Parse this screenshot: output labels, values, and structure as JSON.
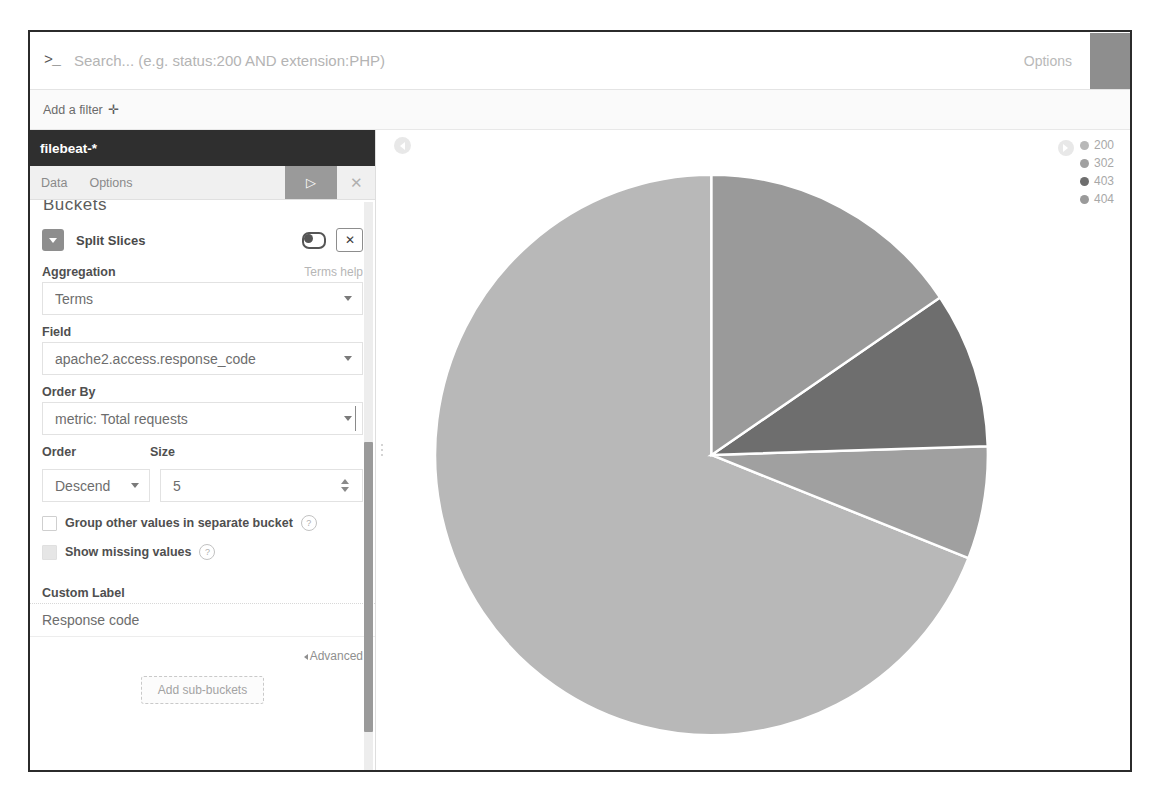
{
  "query_bar": {
    "prompt_glyph": ">_",
    "search_value": "",
    "search_placeholder": "Search... (e.g. status:200 AND extension:PHP)",
    "options_label": "Options",
    "submit_icon": "search-submit-icon"
  },
  "filter_bar": {
    "add_filter_label": "Add a filter",
    "add_filter_glyph": "✛"
  },
  "sidebar": {
    "index_pattern": "filebeat-*",
    "tabs": [
      {
        "label": "Data"
      },
      {
        "label": "Options"
      }
    ],
    "apply_glyph": "▷",
    "discard_glyph": "✕",
    "buckets_heading": "Buckets",
    "agg": {
      "title": "Split Slices",
      "collapse_icon": "caret-down-icon",
      "toggle_icon": "enable-toggle",
      "remove_glyph": "✕",
      "aggregation_label": "Aggregation",
      "aggregation_help": "Terms help",
      "aggregation_value": "Terms",
      "field_label": "Field",
      "field_value": "apache2.access.response_code",
      "order_by_label": "Order By",
      "order_by_value": "metric: Total requests",
      "order_label": "Order",
      "order_value": "Descend",
      "size_label": "Size",
      "size_value": "5",
      "group_other_label": "Group other values in separate bucket",
      "show_missing_label": "Show missing values",
      "help_glyph": "?",
      "custom_label_label": "Custom Label",
      "custom_label_value": "Response code",
      "custom_label_placeholder": "",
      "advanced_label": "Advanced",
      "add_subbuckets_label": "Add sub-buckets"
    }
  },
  "visualization": {
    "collapse_icon": "collapse-left-icon",
    "legend_toggle_icon": "legend-toggle-icon"
  },
  "chart_data": {
    "type": "pie",
    "title": "",
    "legend_position": "top-right",
    "labels": [
      "200",
      "302",
      "403",
      "404"
    ],
    "values": [
      69.0,
      6.5,
      9.0,
      15.5
    ],
    "colors": [
      "#b8b8b8",
      "#a0a0a0",
      "#6e6e6e",
      "#9a9a9a"
    ],
    "slice_border_color": "#ffffff",
    "start_angle_deg": 0,
    "direction": "counterclockwise",
    "center_x": 733,
    "center_y": 455,
    "radius": 282,
    "legend": [
      {
        "label": "200",
        "color": "#b8b8b8"
      },
      {
        "label": "302",
        "color": "#a0a0a0"
      },
      {
        "label": "403",
        "color": "#6e6e6e"
      },
      {
        "label": "404",
        "color": "#9a9a9a"
      }
    ]
  }
}
